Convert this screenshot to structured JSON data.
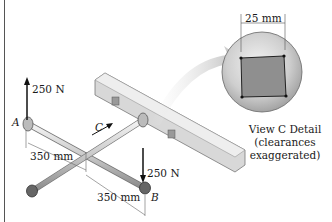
{
  "figure": {
    "labels": {
      "force_a": "250 N",
      "force_b": "250 N",
      "point_a": "A",
      "point_b": "B",
      "view_c": "C",
      "dim_arm_1": "350 mm",
      "dim_arm_2": "350 mm",
      "dim_square": "25 mm"
    },
    "caption": {
      "line1": "View C Detail",
      "line2": "(clearances exaggerated)"
    }
  }
}
